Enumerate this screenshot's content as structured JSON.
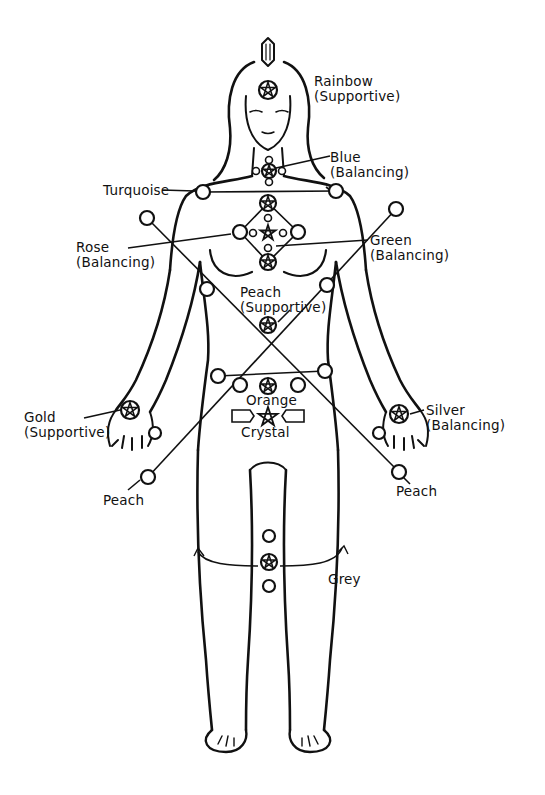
{
  "diagram": {
    "stroke_color": "#111111",
    "background": "#ffffff"
  },
  "labels": [
    {
      "id": "rainbow",
      "text": "Rainbow",
      "sub": "(Supportive)",
      "x": 314,
      "y": 74
    },
    {
      "id": "blue",
      "text": "Blue",
      "sub": "(Balancing)",
      "x": 330,
      "y": 150
    },
    {
      "id": "turquoise",
      "text": "Turquoise",
      "sub": "",
      "x": 103,
      "y": 183
    },
    {
      "id": "rose",
      "text": "Rose",
      "sub": "(Balancing)",
      "x": 76,
      "y": 240
    },
    {
      "id": "green",
      "text": "Green",
      "sub": "(Balancing)",
      "x": 370,
      "y": 233
    },
    {
      "id": "peach-center",
      "text": "Peach",
      "sub": "(Supportive)",
      "x": 240,
      "y": 285
    },
    {
      "id": "orange",
      "text": "Orange",
      "sub": "",
      "x": 246,
      "y": 393
    },
    {
      "id": "crystal",
      "text": "Crystal",
      "sub": "",
      "x": 241,
      "y": 425
    },
    {
      "id": "gold",
      "text": "Gold",
      "sub": "(Supportive)",
      "x": 24,
      "y": 410
    },
    {
      "id": "silver",
      "text": "Silver",
      "sub": "(Balancing)",
      "x": 426,
      "y": 403
    },
    {
      "id": "peach-left",
      "text": "Peach",
      "sub": "",
      "x": 103,
      "y": 493
    },
    {
      "id": "peach-right",
      "text": "Peach",
      "sub": "",
      "x": 396,
      "y": 484
    },
    {
      "id": "grey",
      "text": "Grey",
      "sub": "",
      "x": 328,
      "y": 572
    }
  ],
  "markers": {
    "stars_circled": [
      {
        "name": "rainbow-brow",
        "x": 268,
        "y": 90,
        "r": 9
      },
      {
        "name": "blue-throat",
        "x": 269,
        "y": 171,
        "r": 7
      },
      {
        "name": "heart-top",
        "x": 268,
        "y": 203,
        "r": 8
      },
      {
        "name": "heart-bottom",
        "x": 268,
        "y": 262,
        "r": 8
      },
      {
        "name": "peach-solar",
        "x": 268,
        "y": 325,
        "r": 8
      },
      {
        "name": "orange-sacral",
        "x": 268,
        "y": 386,
        "r": 8
      },
      {
        "name": "gold-left-hand",
        "x": 130,
        "y": 410,
        "r": 9
      },
      {
        "name": "silver-right-hand",
        "x": 399,
        "y": 414,
        "r": 9
      },
      {
        "name": "grey-knee",
        "x": 269,
        "y": 562,
        "r": 8
      }
    ],
    "stars_plain": [
      {
        "name": "heart-center",
        "x": 268,
        "y": 233,
        "r": 8
      },
      {
        "name": "crystal-pubic",
        "x": 268,
        "y": 417,
        "r": 10
      }
    ],
    "circles_large": [
      {
        "name": "turquoise-left",
        "x": 203,
        "y": 192,
        "r": 7
      },
      {
        "name": "turquoise-right",
        "x": 336,
        "y": 191,
        "r": 7
      },
      {
        "name": "rose-left",
        "x": 240,
        "y": 232,
        "r": 7
      },
      {
        "name": "rose-right",
        "x": 298,
        "y": 232,
        "r": 7
      },
      {
        "name": "cross-upper-left",
        "x": 147,
        "y": 218,
        "r": 7
      },
      {
        "name": "cross-upper-right",
        "x": 396,
        "y": 209,
        "r": 7
      },
      {
        "name": "cross-mid-left",
        "x": 207,
        "y": 289,
        "r": 7
      },
      {
        "name": "cross-mid-right",
        "x": 327,
        "y": 285,
        "r": 7
      },
      {
        "name": "hip-outer-left",
        "x": 218,
        "y": 376,
        "r": 7
      },
      {
        "name": "hip-inner-left",
        "x": 240,
        "y": 385,
        "r": 7
      },
      {
        "name": "hip-inner-right",
        "x": 298,
        "y": 385,
        "r": 7
      },
      {
        "name": "hip-outer-right",
        "x": 325,
        "y": 371,
        "r": 7
      },
      {
        "name": "thigh-left",
        "x": 155,
        "y": 433,
        "r": 6
      },
      {
        "name": "thigh-right",
        "x": 379,
        "y": 433,
        "r": 6
      },
      {
        "name": "peach-left-foot",
        "x": 148,
        "y": 477,
        "r": 7
      },
      {
        "name": "peach-right-foot",
        "x": 399,
        "y": 472,
        "r": 7
      },
      {
        "name": "knee-above",
        "x": 269,
        "y": 536,
        "r": 6
      },
      {
        "name": "knee-below",
        "x": 269,
        "y": 586,
        "r": 6
      }
    ],
    "circles_small": [
      {
        "name": "throat-top",
        "x": 269,
        "y": 160,
        "r": 3.5
      },
      {
        "name": "throat-left",
        "x": 256,
        "y": 171,
        "r": 3.5
      },
      {
        "name": "throat-right",
        "x": 282,
        "y": 171,
        "r": 3.5
      },
      {
        "name": "throat-bottom",
        "x": 269,
        "y": 182,
        "r": 3.5
      },
      {
        "name": "heart-upper",
        "x": 268,
        "y": 218,
        "r": 3.5
      },
      {
        "name": "heart-lower",
        "x": 268,
        "y": 248,
        "r": 3.5
      },
      {
        "name": "heart-left",
        "x": 253,
        "y": 233,
        "r": 3.5
      },
      {
        "name": "heart-right",
        "x": 283,
        "y": 233,
        "r": 3.5
      }
    ]
  }
}
